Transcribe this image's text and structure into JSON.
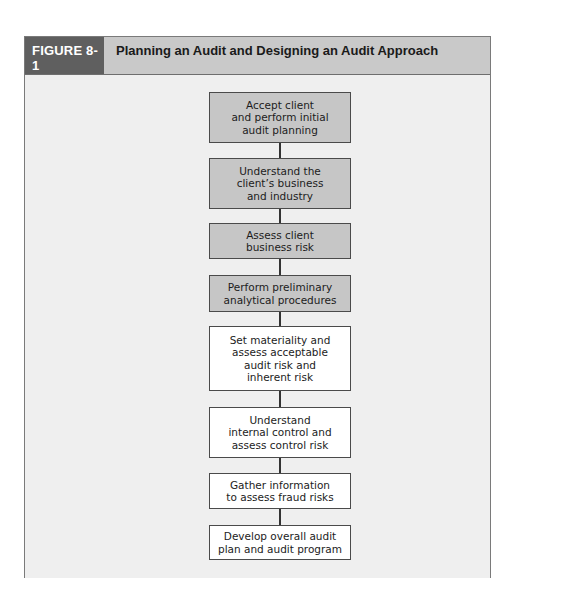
{
  "figure": {
    "label": "FIGURE 8-1",
    "title": "Planning an Audit and Designing an Audit Approach"
  },
  "colors": {
    "label_bg": "#5f5f5f",
    "header_bg": "#c9c9c9",
    "body_bg": "#efefef",
    "shaded_step": "#c6c6c6",
    "plain_step": "#ffffff"
  },
  "steps": [
    {
      "text": "Accept client\nand perform initial\naudit planning",
      "style": "shaded"
    },
    {
      "text": "Understand the\nclient’s business\nand industry",
      "style": "shaded"
    },
    {
      "text": "Assess client\nbusiness risk",
      "style": "shaded"
    },
    {
      "text": "Perform preliminary\nanalytical procedures",
      "style": "shaded"
    },
    {
      "text": "Set materiality and\nassess acceptable\naudit risk and\ninherent risk",
      "style": "plain"
    },
    {
      "text": "Understand\ninternal control and\nassess control risk",
      "style": "plain"
    },
    {
      "text": "Gather information\nto assess fraud risks",
      "style": "plain"
    },
    {
      "text": "Develop overall audit\nplan and audit program",
      "style": "plain"
    }
  ]
}
